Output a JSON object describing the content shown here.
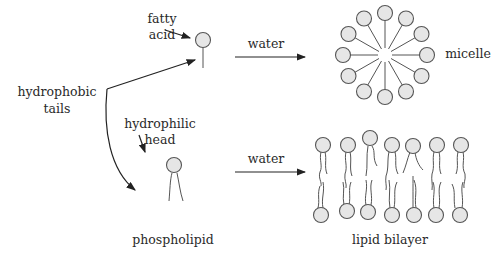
{
  "diagram": {
    "labels": {
      "fatty_acid_line1": "fatty",
      "fatty_acid_line2": "acid",
      "hydrophobic_line1": "hydrophobic",
      "hydrophobic_line2": "tails",
      "hydrophilic_line1": "hydrophilic",
      "hydrophilic_line2": "head",
      "water_top": "water",
      "water_bottom": "water",
      "micelle": "micelle",
      "phospholipid": "phospholipid",
      "lipid_bilayer": "lipid bilayer"
    },
    "colors": {
      "head_fill": "#e6e6e6",
      "stroke": "#555555",
      "text": "#2a2a2a"
    },
    "micelle_head_count": 12,
    "bilayer_columns": 7
  }
}
